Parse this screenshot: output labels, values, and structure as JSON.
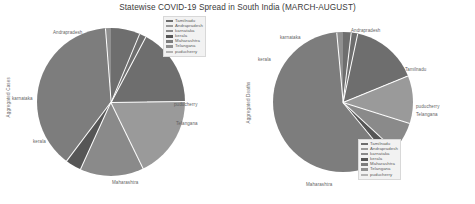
{
  "figure": {
    "title": "Statewise COVID-19 Spread in South India (MARCH-AUGUST)",
    "background": "#ffffff"
  },
  "palette": {
    "tamilnadu": "#6e6e6e",
    "andrapradesh": "#9a9a9a",
    "karnataka": "#8a8a8a",
    "kerala": "#565656",
    "maharashtra": "#7d7d7d",
    "telangana": "#909090",
    "puducherry": "#b4b4b4"
  },
  "chart_data": [
    {
      "type": "pie",
      "title": "Aggregated Cases",
      "ylabel": "Aggregated Cases",
      "legend_position": "upper-left",
      "categories": [
        "Tamilnadu",
        "Andrapradesh",
        "karnataka",
        "kerala",
        "Maharashtra",
        "Telangana",
        "puducherry"
      ],
      "values": [
        17.0,
        18.0,
        14.0,
        3.5,
        38.5,
        7.5,
        1.5
      ],
      "labels_shown": [
        "Andrapradesh",
        "karnataka",
        "kerala",
        "Maharashtra",
        "Telangana",
        "puducherry"
      ]
    },
    {
      "type": "pie",
      "title": "Aggregated Deaths",
      "ylabel": "Aggregated Deaths",
      "legend_position": "lower-right",
      "categories": [
        "Tamilnadu",
        "Andrapradesh",
        "karnataka",
        "kerala",
        "Maharashtra",
        "Telangana",
        "puducherry"
      ],
      "values": [
        15.5,
        11.0,
        7.0,
        2.2,
        59.5,
        3.3,
        1.5
      ],
      "labels_shown": [
        "Andrapradesh",
        "karnataka",
        "kerala",
        "Tamilnadu",
        "puducherry",
        "Telangana",
        "Maharashtra"
      ]
    }
  ],
  "legend_left": {
    "items": [
      {
        "label": "Tamilnadu",
        "color": "#6e6e6e"
      },
      {
        "label": "Andrapradesh",
        "color": "#9a9a9a"
      },
      {
        "label": "karnataka",
        "color": "#8a8a8a"
      },
      {
        "label": "kerala",
        "color": "#565656"
      },
      {
        "label": "Maharashtra",
        "color": "#7d7d7d"
      },
      {
        "label": "Telangana",
        "color": "#909090"
      },
      {
        "label": "puducherry",
        "color": "#b4b4b4"
      }
    ]
  },
  "legend_right": {
    "items": [
      {
        "label": "Tamilnadu",
        "color": "#6e6e6e"
      },
      {
        "label": "Andrapradesh",
        "color": "#9a9a9a"
      },
      {
        "label": "karnataka",
        "color": "#8a8a8a"
      },
      {
        "label": "kerala",
        "color": "#565656"
      },
      {
        "label": "Maharashtra",
        "color": "#7d7d7d"
      },
      {
        "label": "Telangana",
        "color": "#909090"
      },
      {
        "label": "puducherry",
        "color": "#b4b4b4"
      }
    ]
  },
  "labels_left": {
    "andrapradesh": "Andrapradesh",
    "karnataka": "karnataka",
    "kerala": "kerala",
    "maharashtra": "Maharashtra",
    "telangana": "Telangana",
    "puducherry": "puducherry",
    "ylabel": "Aggregated Cases"
  },
  "labels_right": {
    "andrapradesh": "Andrapradesh",
    "karnataka": "karnataka",
    "kerala": "kerala",
    "maharashtra": "Maharashtra",
    "telangana": "Telangana",
    "puducherry": "puducherry",
    "tamilnadu": "Tamilnadu",
    "ylabel": "Aggregated Deaths"
  }
}
